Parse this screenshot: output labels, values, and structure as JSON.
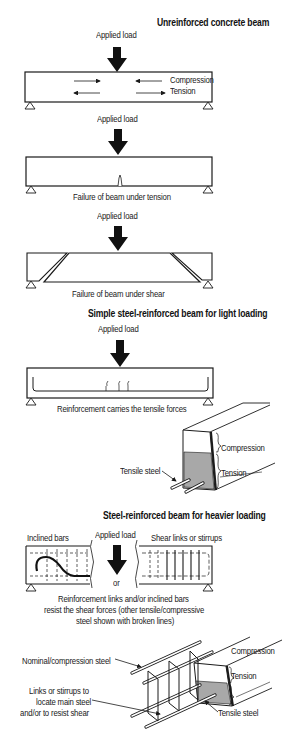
{
  "panels": {
    "unreinforced": {
      "title": "Unreinforced concrete beam",
      "load_label": "Applied load",
      "compression_label": "Compression",
      "tension_label": "Tension"
    },
    "tension_failure": {
      "load_label": "Applied load",
      "caption": "Failure of beam under tension"
    },
    "shear_failure": {
      "load_label": "Applied load",
      "caption": "Failure of beam under shear"
    },
    "light_loading": {
      "title": "Simple steel-reinforced beam for light loading",
      "load_label": "Applied load",
      "caption": "Reinforcement carries the tensile forces",
      "section": {
        "compression_label": "Compression",
        "tension_label": "Tension",
        "steel_label": "Tensile steel"
      }
    },
    "heavy_loading": {
      "title": "Steel-reinforced beam for heavier loading",
      "load_label": "Applied load",
      "inclined_label": "Inclined bars",
      "stirrups_label": "Shear links or stirrups",
      "or_label": "or",
      "caption_lines": [
        "Reinforcement links and/or inclined bars",
        "resist the shear forces (other tensile/compressive",
        "steel shown with broken lines)"
      ],
      "section": {
        "nominal_label": "Nominal/compression steel",
        "links_lines": [
          "Links or stirrups to",
          "locate main steel",
          "and/or to resist shear"
        ],
        "compression_label": "Compression",
        "tension_label": "Tension",
        "steel_label": "Tensile steel"
      }
    }
  },
  "colors": {
    "line": "#1a1a1a",
    "tension_fill": "#a8a8a8",
    "background": "#ffffff"
  }
}
